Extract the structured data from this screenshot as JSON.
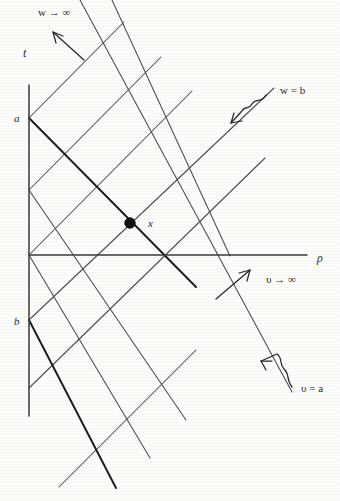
{
  "figure": {
    "kind": "spacetime-light-cone-diagram",
    "background_color": "#fdfdfb",
    "ink_color": "#333333",
    "axes": {
      "vertical": {
        "label": "t",
        "label_x": 23,
        "label_y": 57,
        "x": 29,
        "y_top": 85,
        "y_bottom": 416
      },
      "horizontal": {
        "label": "ρ",
        "label_x": 317,
        "label_y": 262,
        "y": 255,
        "x_left": 29,
        "x_right": 307
      },
      "origin": {
        "x": 29,
        "y": 255
      }
    },
    "marked_points": [
      {
        "name": "a",
        "label": "a",
        "label_x": 14,
        "label_y": 122,
        "x": 29,
        "y": 118
      },
      {
        "name": "b",
        "label": "b",
        "label_x": 14,
        "label_y": 325,
        "x": 29,
        "y": 320
      }
    ],
    "event_point": {
      "label": "x",
      "label_x": 148,
      "label_y": 224,
      "x": 130,
      "y": 223,
      "radius": 5.2
    },
    "annotations": [
      {
        "name": "w-to-infinity",
        "text": "w → ∞",
        "x": 38,
        "y": 16
      },
      {
        "name": "v-to-infinity",
        "text": "υ → ∞",
        "x": 266,
        "y": 283
      },
      {
        "name": "w-equals-b",
        "text": "w = b",
        "x": 280,
        "y": 94
      },
      {
        "name": "v-equals-a",
        "text": "υ = a",
        "x": 301,
        "y": 392
      }
    ],
    "pointer_arrows": [
      {
        "name": "w-infinity-arrow",
        "x1": 84,
        "y1": 60,
        "x2": 52,
        "y2": 31,
        "style": "straight"
      },
      {
        "name": "v-infinity-arrow",
        "x1": 216,
        "y1": 299,
        "x2": 250,
        "y2": 270,
        "style": "straight"
      },
      {
        "name": "w-equals-b-arrow",
        "x1": 262,
        "y1": 98,
        "x2": 230,
        "y2": 124,
        "style": "squiggle"
      },
      {
        "name": "v-equals-a-arrow",
        "x1": 291,
        "y1": 385,
        "x2": 260,
        "y2": 360,
        "style": "squiggle"
      }
    ],
    "up_lines": [
      {
        "name": "up-line-1",
        "x1": 29,
        "y1": 118,
        "x2": 124,
        "y2": 22
      },
      {
        "name": "up-line-2",
        "x1": 29,
        "y1": 190,
        "x2": 161,
        "y2": 57
      },
      {
        "name": "up-line-3",
        "x1": 29,
        "y1": 255,
        "x2": 192,
        "y2": 91
      },
      {
        "name": "up-line-4",
        "x1": 29,
        "y1": 320,
        "x2": 274,
        "y2": 88
      },
      {
        "name": "up-line-5",
        "x1": 29,
        "y1": 388,
        "x2": 265,
        "y2": 158
      },
      {
        "name": "up-line-6",
        "x1": 59,
        "y1": 487,
        "x2": 196,
        "y2": 350
      }
    ],
    "down_lines": [
      {
        "name": "down-line-1",
        "x1": 29,
        "y1": 118,
        "x2": 195,
        "y2": 286
      },
      {
        "name": "down-line-2",
        "x1": 29,
        "y1": 190,
        "x2": 186,
        "y2": 420
      },
      {
        "name": "down-line-3",
        "x1": 29,
        "y1": 255,
        "x2": 150,
        "y2": 458
      },
      {
        "name": "down-line-4",
        "x1": 29,
        "y1": 320,
        "x2": 116,
        "y2": 488
      },
      {
        "name": "down-line-5",
        "x1": 80,
        "y1": 0,
        "x2": 290,
        "y2": 390
      },
      {
        "name": "down-line-6",
        "x1": 112,
        "y1": 0,
        "x2": 228,
        "y2": 255
      }
    ],
    "bold_segments": [
      {
        "name": "bold-ray-from-a",
        "x1": 29,
        "y1": 118,
        "x2": 195,
        "y2": 286
      },
      {
        "name": "bold-ray-from-b",
        "x1": 29,
        "y1": 320,
        "x2": 116,
        "y2": 488
      }
    ]
  }
}
